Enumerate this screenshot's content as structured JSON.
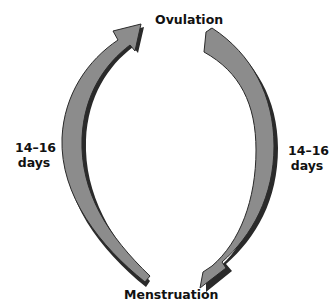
{
  "diagram": {
    "top_label": "Ovulation",
    "bottom_label": "Menstruation",
    "left_interval": {
      "line1": "14–16",
      "line2": "days"
    },
    "right_interval": {
      "line1": "14–16",
      "line2": "days"
    },
    "arrows": [
      {
        "name": "menstruation-to-ovulation",
        "direction": "up",
        "side": "left",
        "from": "Menstruation",
        "to": "Ovulation"
      },
      {
        "name": "ovulation-to-menstruation",
        "direction": "down",
        "side": "right",
        "from": "Ovulation",
        "to": "Menstruation"
      }
    ],
    "colors": {
      "arrow_fill": "#8c8c8c",
      "arrow_shadow": "#2a2a2a",
      "text": "#111111",
      "background": "#ffffff"
    }
  }
}
